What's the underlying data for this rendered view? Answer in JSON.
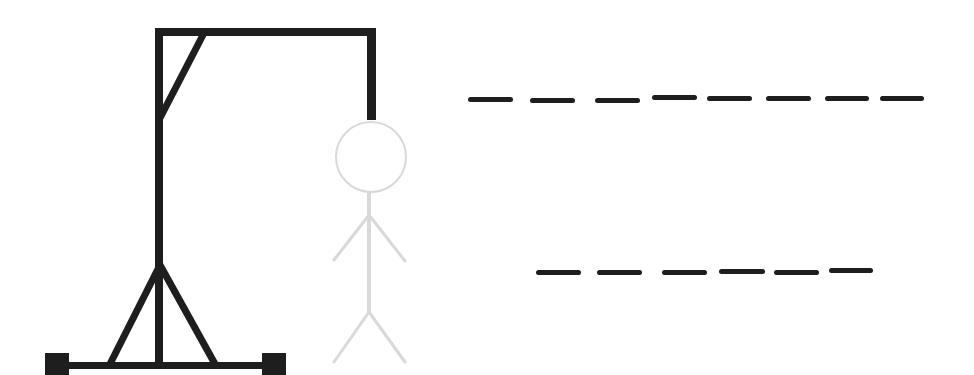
{
  "game": {
    "type": "hangman",
    "gallows_color": "#1e1e1e",
    "figure_color": "#d9d9d9",
    "figure_state": "full-body-faded",
    "figure_parts": [
      "head",
      "body",
      "left-arm",
      "right-arm",
      "left-leg",
      "right-leg"
    ]
  },
  "word": {
    "lines": [
      {
        "letter_count": 8,
        "slots": [
          {
            "x": 468,
            "y": 97,
            "w": 45,
            "letter": ""
          },
          {
            "x": 530,
            "y": 98,
            "w": 45,
            "letter": ""
          },
          {
            "x": 595,
            "y": 98,
            "w": 45,
            "letter": ""
          },
          {
            "x": 652,
            "y": 95,
            "w": 45,
            "letter": ""
          },
          {
            "x": 707,
            "y": 96,
            "w": 45,
            "letter": ""
          },
          {
            "x": 766,
            "y": 96,
            "w": 45,
            "letter": ""
          },
          {
            "x": 825,
            "y": 96,
            "w": 44,
            "letter": ""
          },
          {
            "x": 880,
            "y": 96,
            "w": 44,
            "letter": ""
          }
        ]
      },
      {
        "letter_count": 6,
        "slots": [
          {
            "x": 536,
            "y": 270,
            "w": 45,
            "letter": ""
          },
          {
            "x": 597,
            "y": 270,
            "w": 45,
            "letter": ""
          },
          {
            "x": 662,
            "y": 270,
            "w": 45,
            "letter": ""
          },
          {
            "x": 719,
            "y": 269,
            "w": 46,
            "letter": ""
          },
          {
            "x": 774,
            "y": 270,
            "w": 45,
            "letter": ""
          },
          {
            "x": 829,
            "y": 268,
            "w": 44,
            "letter": ""
          }
        ]
      }
    ]
  }
}
